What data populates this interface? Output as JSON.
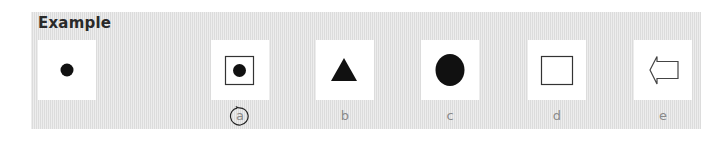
{
  "worksheet": {
    "heading": "Example",
    "prompt_item": {
      "shape": "small-filled-circle",
      "icon": "dot-icon"
    },
    "options": [
      {
        "letter": "a",
        "shape": "small-filled-circle-in-square",
        "icon": "dot-in-square-icon",
        "selected": true
      },
      {
        "letter": "b",
        "shape": "filled-triangle",
        "icon": "triangle-icon",
        "selected": false
      },
      {
        "letter": "c",
        "shape": "large-filled-circle",
        "icon": "large-circle-icon",
        "selected": false
      },
      {
        "letter": "d",
        "shape": "square-outline",
        "icon": "square-outline-icon",
        "selected": false
      },
      {
        "letter": "e",
        "shape": "left-arrow-outline",
        "icon": "left-arrow-icon",
        "selected": false
      }
    ],
    "selected_answer": "a"
  },
  "colors": {
    "panel_bg": "#e3e3e3",
    "card_bg": "#ffffff",
    "shape_fill": "#111111",
    "label_text": "#8a8a8a",
    "heading_text": "#2a2a2a"
  }
}
